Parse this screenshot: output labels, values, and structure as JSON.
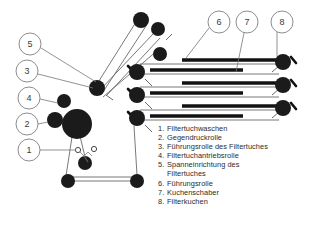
{
  "figure": {
    "background_color": "#ffffff",
    "ink_color": "#1a1a1a",
    "line_color": "#555555"
  },
  "callouts": [
    {
      "id": "5",
      "label": "5",
      "cx": 30,
      "cy": 44,
      "r": 11
    },
    {
      "id": "3",
      "label": "3",
      "cx": 27,
      "cy": 71,
      "r": 11
    },
    {
      "id": "4",
      "label": "4",
      "cx": 29,
      "cy": 98,
      "r": 11
    },
    {
      "id": "2",
      "label": "2",
      "cx": 27,
      "cy": 124,
      "r": 11
    },
    {
      "id": "1",
      "label": "1",
      "cx": 29,
      "cy": 150,
      "r": 11
    },
    {
      "id": "6",
      "label": "6",
      "cx": 219,
      "cy": 22,
      "r": 11
    },
    {
      "id": "7",
      "label": "7",
      "cx": 247,
      "cy": 22,
      "r": 11
    },
    {
      "id": "8",
      "label": "8",
      "cx": 282,
      "cy": 22,
      "r": 11
    }
  ],
  "legend": {
    "items": [
      {
        "number": "1.",
        "text": "Filtertuchwaschen"
      },
      {
        "number": "2.",
        "text": "Gegendruckrolle"
      },
      {
        "number": "3.",
        "text": "Führungsrolle des Filtertuches"
      },
      {
        "number": "4.",
        "text": "Filtertuchantriebsrolle"
      },
      {
        "number": "5.",
        "text": "Spanneinrichtung des"
      },
      {
        "number": "",
        "text": "Filtertuches"
      },
      {
        "number": "6.",
        "text": "Führungsrolle"
      },
      {
        "number": "7.",
        "text": "Kuchenschaber"
      },
      {
        "number": "8.",
        "text": "Filterkuchen"
      }
    ]
  },
  "rollers": [
    {
      "name": "top-roller-a",
      "cx": 141,
      "cy": 20,
      "r": 8
    },
    {
      "name": "top-roller-b",
      "cx": 158,
      "cy": 29,
      "r": 7
    },
    {
      "name": "top-roller-c",
      "cx": 160,
      "cy": 54,
      "r": 7
    },
    {
      "name": "guide-roller-upper",
      "cx": 97,
      "cy": 88,
      "r": 8
    },
    {
      "name": "drive-roller-main",
      "cx": 77,
      "cy": 124,
      "r": 15
    },
    {
      "name": "counter-pressure-roller",
      "cx": 55,
      "cy": 120,
      "r": 8
    },
    {
      "name": "guide-roller-left",
      "cx": 64,
      "cy": 101,
      "r": 7
    },
    {
      "name": "tension-roller",
      "cx": 85,
      "cy": 163,
      "r": 7
    },
    {
      "name": "bottom-roller-left",
      "cx": 68,
      "cy": 181,
      "r": 7
    },
    {
      "name": "bottom-roller-right",
      "cx": 137,
      "cy": 181,
      "r": 7
    },
    {
      "name": "belt-roller-l1",
      "cx": 137,
      "cy": 72,
      "r": 8
    },
    {
      "name": "belt-roller-l2",
      "cx": 137,
      "cy": 95,
      "r": 8
    },
    {
      "name": "belt-roller-l3",
      "cx": 137,
      "cy": 118,
      "r": 8
    },
    {
      "name": "belt-roller-r1",
      "cx": 283,
      "cy": 62,
      "r": 8
    },
    {
      "name": "belt-roller-r2",
      "cx": 283,
      "cy": 85,
      "r": 8
    },
    {
      "name": "belt-roller-r3",
      "cx": 283,
      "cy": 108,
      "r": 8
    }
  ],
  "cake_bars": [
    {
      "name": "filter-cake-1",
      "x1": 182,
      "y1": 60,
      "x2": 277,
      "y2": 60
    },
    {
      "name": "filter-cake-2",
      "x1": 150,
      "y1": 70,
      "x2": 243,
      "y2": 70
    },
    {
      "name": "filter-cake-3",
      "x1": 182,
      "y1": 83,
      "x2": 277,
      "y2": 83
    },
    {
      "name": "filter-cake-4",
      "x1": 150,
      "y1": 93,
      "x2": 243,
      "y2": 93
    },
    {
      "name": "filter-cake-5",
      "x1": 182,
      "y1": 106,
      "x2": 277,
      "y2": 106
    },
    {
      "name": "filter-cake-6",
      "x1": 150,
      "y1": 116,
      "x2": 243,
      "y2": 116
    }
  ]
}
